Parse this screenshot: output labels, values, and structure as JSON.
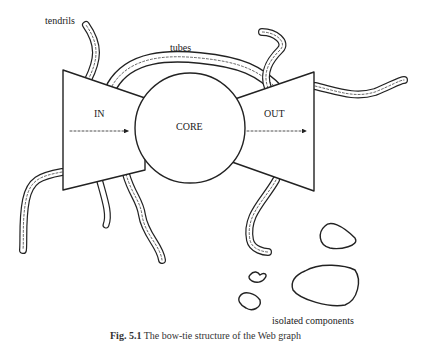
{
  "diagram": {
    "labels": {
      "tendrils": "tendrils",
      "tubes": "tubes",
      "in": "IN",
      "core": "CORE",
      "out": "OUT",
      "isolated": "isolated components"
    },
    "caption": {
      "prefix": "Fig. 5.1",
      "text": "The bow-tie structure of the Web graph"
    },
    "colors": {
      "stroke": "#222222",
      "background": "#ffffff"
    }
  }
}
